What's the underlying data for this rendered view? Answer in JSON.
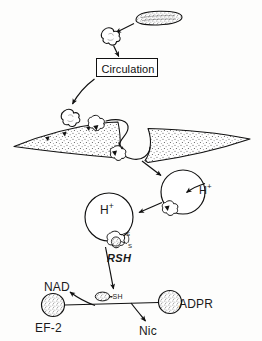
{
  "figure": {
    "type": "biological-pathway-diagram",
    "background_color": "#fdfdfc",
    "ink_color": "#1a1a1a"
  },
  "labels": {
    "circulation": "Circulation",
    "proton_endosome_1": "H",
    "proton_endosome_1_charge": "+",
    "proton_endosome_2": "H",
    "proton_endosome_2_charge": "+",
    "reducing_agent": "RSH",
    "nad": "NAD",
    "ef2": "EF-2",
    "thiol": "-SH",
    "nicotinamide": "Nic",
    "adp_ribose": "ADPR",
    "sulfur_upper": "S",
    "sulfur_lower": "S"
  },
  "elements": [
    {
      "name": "bacterium",
      "description": "stippled rod-shaped bacterium, top right"
    },
    {
      "name": "toxin-blob-secreted",
      "description": "irregular cloud-shaped toxin released from bacterium"
    },
    {
      "name": "circulation-box",
      "description": "rectangular box labeled Circulation"
    },
    {
      "name": "toxin-blob-free",
      "description": "free toxin blob above cell membrane"
    },
    {
      "name": "cell-membrane",
      "description": "stippled curved band representing cell surface"
    },
    {
      "name": "membrane-receptors",
      "description": "black triangular receptor markers on membrane"
    },
    {
      "name": "toxin-receptor-complex",
      "description": "toxin bound to receptor at membrane"
    },
    {
      "name": "endocytic-invagination",
      "description": "membrane invagination forming coated pit"
    },
    {
      "name": "endosome-acidified",
      "description": "circle with proton influx arrow labeled H+"
    },
    {
      "name": "endosome-second",
      "description": "second circle labeled H+ with disulfide-linked toxin"
    },
    {
      "name": "disulfide-bond",
      "description": "S-S bond on translocating toxin fragment"
    },
    {
      "name": "fragment-a",
      "description": "small oval fragment A bearing free -SH"
    },
    {
      "name": "ef2-circle",
      "description": "stippled circle representing elongation factor 2"
    },
    {
      "name": "adpr-circle",
      "description": "stippled circle representing ADP-ribose"
    }
  ],
  "arrows": [
    {
      "name": "arrow-bacterium-to-toxin",
      "from": "bacterium",
      "to": "toxin-blob-secreted"
    },
    {
      "name": "arrow-toxin-to-circulation",
      "from": "toxin-blob-secreted",
      "to": "circulation-box"
    },
    {
      "name": "arrow-circulation-to-membrane",
      "from": "circulation-box",
      "to": "toxin-blob-free"
    },
    {
      "name": "arrow-internalization",
      "from": "membrane",
      "to": "endocytic-invagination"
    },
    {
      "name": "arrow-vesicle-to-endosome",
      "from": "endocytic-invagination",
      "to": "endosome-acidified"
    },
    {
      "name": "arrow-proton-influx-1",
      "label": "H+",
      "to": "endosome-acidified"
    },
    {
      "name": "arrow-endosome-to-endosome",
      "from": "endosome-acidified",
      "to": "endosome-second"
    },
    {
      "name": "arrow-rsh-reduction",
      "label": "RSH",
      "to": "fragment-a"
    },
    {
      "name": "arrow-nad-to-ef2",
      "label": "NAD",
      "to": "ef2-circle"
    },
    {
      "name": "arrow-to-nic",
      "label": "Nic",
      "from": "adpr-circle"
    }
  ]
}
